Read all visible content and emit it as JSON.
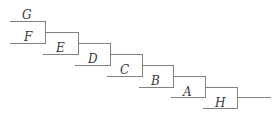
{
  "figure": {
    "type": "dendrogram",
    "background_color": "#ffffff",
    "line_color": "#808080",
    "label_color": "#3a3a3a",
    "width": 278,
    "height": 128
  },
  "chart_data": {
    "type": "tree",
    "title": "",
    "xlabel": "",
    "ylabel": "",
    "orientation": "horizontal-ladder",
    "topology": "caterpillar",
    "newick": "(((((((G,F)E)D)C)B)A)H);",
    "leaf_order": [
      "G",
      "F",
      "E",
      "D",
      "C",
      "B",
      "A",
      "H"
    ],
    "leaves": [
      {
        "id": "leaf-G",
        "label": "G",
        "tip_x": 10,
        "tip_y": 21,
        "node_x": 45,
        "label_x": 22,
        "label_y": 9
      },
      {
        "id": "leaf-F",
        "label": "F",
        "tip_x": 10,
        "tip_y": 43,
        "node_x": 45,
        "label_x": 24,
        "label_y": 31
      },
      {
        "id": "leaf-E",
        "label": "E",
        "tip_x": 43,
        "tip_y": 54,
        "node_x": 78,
        "label_x": 56,
        "label_y": 42
      },
      {
        "id": "leaf-D",
        "label": "D",
        "tip_x": 75,
        "tip_y": 65,
        "node_x": 110,
        "label_x": 88,
        "label_y": 53
      },
      {
        "id": "leaf-C",
        "label": "C",
        "tip_x": 107,
        "tip_y": 76,
        "node_x": 142,
        "label_x": 120,
        "label_y": 64
      },
      {
        "id": "leaf-B",
        "label": "B",
        "tip_x": 139,
        "tip_y": 87,
        "node_x": 173,
        "label_x": 151,
        "label_y": 75
      },
      {
        "id": "leaf-A",
        "label": "A",
        "tip_x": 171,
        "tip_y": 97,
        "node_x": 205,
        "label_x": 183,
        "label_y": 86
      },
      {
        "id": "leaf-H",
        "label": "H",
        "tip_x": 203,
        "tip_y": 108,
        "node_x": 237,
        "label_x": 215,
        "label_y": 97
      }
    ],
    "internal_nodes": [
      {
        "id": "node-GF",
        "x": 45,
        "y_top": 21,
        "y_bottom": 43,
        "stem_y": 32,
        "stem_x_end": 78,
        "children": [
          "G",
          "F"
        ]
      },
      {
        "id": "node-GFE",
        "x": 78,
        "y_top": 32,
        "y_bottom": 54,
        "stem_y": 43,
        "stem_x_end": 110,
        "children": [
          "node-GF",
          "E"
        ]
      },
      {
        "id": "node-GFED",
        "x": 110,
        "y_top": 43,
        "y_bottom": 65,
        "stem_y": 54,
        "stem_x_end": 142,
        "children": [
          "node-GFE",
          "D"
        ]
      },
      {
        "id": "node-GFEDC",
        "x": 142,
        "y_top": 54,
        "y_bottom": 76,
        "stem_y": 65,
        "stem_x_end": 173,
        "children": [
          "node-GFED",
          "C"
        ]
      },
      {
        "id": "node-GFEDCB",
        "x": 173,
        "y_top": 65,
        "y_bottom": 87,
        "stem_y": 76,
        "stem_x_end": 205,
        "children": [
          "node-GFEDC",
          "B"
        ]
      },
      {
        "id": "node-GFEDCBA",
        "x": 205,
        "y_top": 76,
        "y_bottom": 97,
        "stem_y": 87,
        "stem_x_end": 237,
        "children": [
          "node-GFEDCB",
          "A"
        ]
      },
      {
        "id": "node-root",
        "x": 237,
        "y_top": 87,
        "y_bottom": 108,
        "stem_y": 97,
        "stem_x_end": 270,
        "children": [
          "node-GFEDCBA",
          "H"
        ]
      }
    ]
  }
}
